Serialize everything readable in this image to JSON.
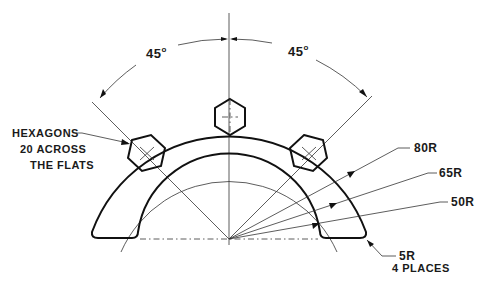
{
  "drawing": {
    "title_partial": "",
    "angles": {
      "left_label": "45",
      "right_label": "45",
      "degree_symbol": "o"
    },
    "hexagon_note": {
      "line1": "HEXAGONS",
      "line2": "20 ACROSS",
      "line3": "THE FLATS"
    },
    "radii": [
      {
        "label": "80R"
      },
      {
        "label": "65R"
      },
      {
        "label": "50R"
      }
    ],
    "fillet_note": {
      "line1": "5R",
      "line2": "4 PLACES"
    },
    "colors": {
      "line": "#111111",
      "background": "#ffffff"
    }
  }
}
